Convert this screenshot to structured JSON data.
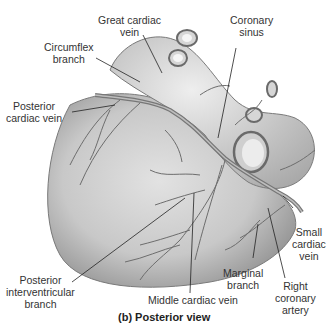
{
  "figure": {
    "caption": "(b) Posterior view",
    "colors": {
      "background": "#ffffff",
      "heart_fill": "#c9c9c9",
      "heart_shadow": "#9a9a9a",
      "vessel": "#6d6d6d",
      "leader_line": "#222222",
      "label_text": "#333333"
    }
  },
  "labels": {
    "great_cardiac_vein": {
      "line1": "Great cardiac",
      "line2": "vein"
    },
    "coronary_sinus": {
      "line1": "Coronary",
      "line2": "sinus"
    },
    "circumflex_branch": {
      "line1": "Circumflex",
      "line2": "branch"
    },
    "posterior_cardiac_vein": {
      "line1": "Posterior",
      "line2": "cardiac vein"
    },
    "small_cardiac_vein": {
      "line1": "Small",
      "line2": "cardiac",
      "line3": "vein"
    },
    "marginal_branch": {
      "line1": "Marginal",
      "line2": "branch"
    },
    "right_coronary_artery": {
      "line1": "Right",
      "line2": "coronary",
      "line3": "artery"
    },
    "posterior_interventricular_branch": {
      "line1": "Posterior",
      "line2": "interventricular",
      "line3": "branch"
    },
    "middle_cardiac_vein": {
      "line1": "Middle cardiac vein"
    }
  }
}
